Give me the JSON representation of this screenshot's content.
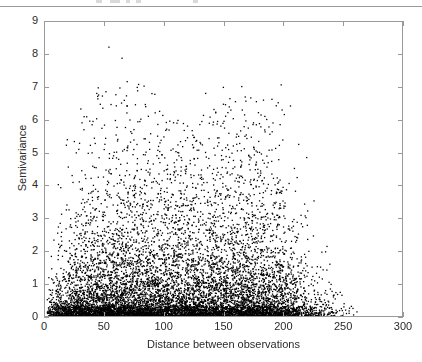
{
  "figure": {
    "background_color": "#ffffff",
    "axis_color": "#9a9a9a",
    "marker_color": "#000000",
    "text_color": "#2b2b2b"
  },
  "chart_data": {
    "type": "scatter",
    "title": "",
    "subtitle": "",
    "xlabel": "Distance between observations",
    "ylabel": "Semivariance",
    "xlim": [
      0,
      300
    ],
    "ylim": [
      0,
      9
    ],
    "xticks": [
      0,
      50,
      100,
      150,
      200,
      250,
      300
    ],
    "xticklabels": [
      "0",
      "50",
      "100",
      "150",
      "200",
      "250",
      "300"
    ],
    "yticks": [
      0,
      1,
      2,
      3,
      4,
      5,
      6,
      7,
      8,
      9
    ],
    "yticklabels": [
      "0",
      "1",
      "2",
      "3",
      "4",
      "5",
      "6",
      "7",
      "8",
      "9"
    ],
    "grid": false,
    "legend": null,
    "legend_position": "none",
    "marker": "point",
    "marker_size_px": 1.3,
    "point_count_approx": 9000,
    "x_data_range": [
      1,
      262
    ],
    "y_data_range": [
      0.0,
      8.5
    ],
    "envelope": {
      "x": [
        0,
        10,
        25,
        40,
        50,
        65,
        80,
        100,
        120,
        140,
        160,
        180,
        195,
        210,
        225,
        240,
        255,
        262
      ],
      "upper": [
        0.6,
        5.0,
        8.0,
        8.3,
        8.5,
        8.0,
        7.9,
        6.1,
        6.0,
        7.3,
        7.1,
        6.9,
        7.5,
        6.6,
        4.2,
        4.2,
        1.3,
        0.5
      ],
      "typical": [
        0.25,
        0.9,
        1.3,
        1.6,
        1.75,
        1.9,
        2.0,
        2.1,
        2.15,
        2.2,
        2.1,
        2.0,
        1.8,
        1.3,
        0.9,
        0.6,
        0.3,
        0.15
      ],
      "density": [
        0.15,
        0.55,
        0.85,
        0.97,
        1.0,
        1.0,
        0.99,
        0.97,
        0.96,
        0.95,
        0.93,
        0.9,
        0.72,
        0.4,
        0.2,
        0.1,
        0.03,
        0.0
      ]
    }
  },
  "top_remnant": {
    "fragments": [
      {
        "left": 96,
        "width": 6
      },
      {
        "left": 110,
        "width": 10
      },
      {
        "left": 126,
        "width": 4
      },
      {
        "left": 136,
        "width": 5
      },
      {
        "left": 193,
        "width": 5
      }
    ]
  }
}
